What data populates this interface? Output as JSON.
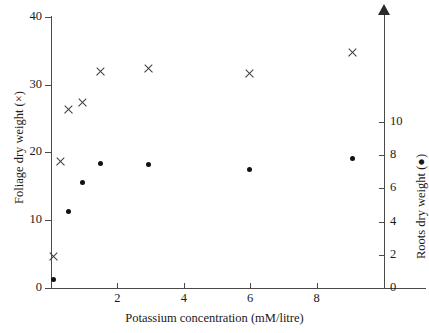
{
  "chart_data": {
    "type": "scatter",
    "title": "",
    "xlabel": "Potassium concentration (mM/litre)",
    "ylabel": "Foliage dry weight (×)",
    "y2label": "Roots dry weight (●)",
    "xlim": [
      0,
      9.8
    ],
    "ylim": [
      0,
      40
    ],
    "y2lim": [
      0,
      11.6
    ],
    "xticks": [
      2,
      4,
      6,
      8
    ],
    "yticks": [
      0,
      10,
      20,
      30,
      40
    ],
    "y2ticks": [
      0,
      2,
      4,
      6,
      8,
      10
    ],
    "grid": false,
    "legend": "none",
    "series": [
      {
        "name": "Foliage dry weight",
        "marker": "cross",
        "axis": "left",
        "color": "#3a3a3a",
        "points": [
          {
            "x": 0.1,
            "y": 4.6
          },
          {
            "x": 0.3,
            "y": 18.6
          },
          {
            "x": 0.55,
            "y": 26.2
          },
          {
            "x": 0.95,
            "y": 27.3
          },
          {
            "x": 1.5,
            "y": 31.8
          },
          {
            "x": 2.95,
            "y": 32.3
          },
          {
            "x": 6.0,
            "y": 31.6
          },
          {
            "x": 9.1,
            "y": 34.6
          }
        ]
      },
      {
        "name": "Roots dry weight",
        "marker": "dot",
        "axis": "right",
        "color": "#111111",
        "points": [
          {
            "x": 0.1,
            "y": 0.5
          },
          {
            "x": 0.55,
            "y": 4.6
          },
          {
            "x": 0.95,
            "y": 6.3
          },
          {
            "x": 1.5,
            "y": 7.5
          },
          {
            "x": 2.95,
            "y": 7.4
          },
          {
            "x": 6.0,
            "y": 7.1
          },
          {
            "x": 9.1,
            "y": 7.8
          }
        ]
      }
    ]
  },
  "axes": {
    "x_title": "Potassium concentration (mM/litre)",
    "y_left_title": "Foliage dry weight (×)",
    "y_right_title": "Roots dry weight (●)",
    "x_tick_labels": [
      "2",
      "4",
      "6",
      "8"
    ],
    "y_left_tick_labels": [
      "40",
      "30",
      "20",
      "10",
      "0"
    ],
    "y_right_tick_labels": [
      "10",
      "8",
      "6",
      "4",
      "2",
      "0"
    ]
  }
}
